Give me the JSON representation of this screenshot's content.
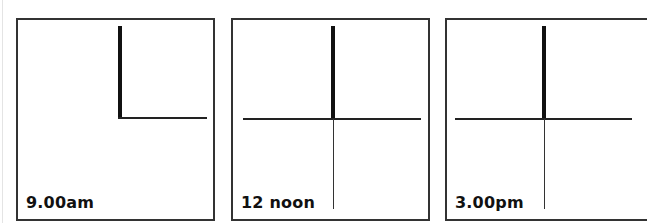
{
  "figure": {
    "panels": [
      {
        "label": "9.00am",
        "stick": "thick-vertical",
        "lines": [
          "horizontal-right-from-stick-base"
        ]
      },
      {
        "label": "12 noon",
        "stick": "thick-vertical",
        "lines": [
          "horizontal-full-width",
          "vertical-down-from-stick-base"
        ]
      },
      {
        "label": "3.00pm",
        "stick": "thick-vertical",
        "lines": [
          "horizontal-full-width",
          "vertical-down-from-stick-base"
        ]
      }
    ]
  },
  "colors": {
    "frame": "#333333",
    "stick": "#111111",
    "line": "#222222",
    "background": "#ffffff"
  }
}
